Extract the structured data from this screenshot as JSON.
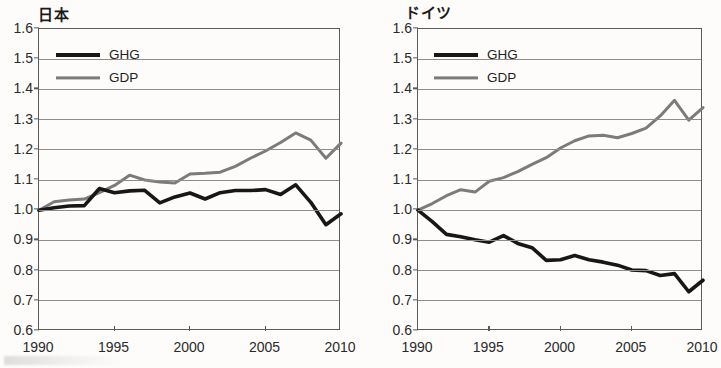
{
  "figure": {
    "background_color": "#fdfcfa",
    "axis_color": "#5a5a5a",
    "grid_color": "#8d8d8d",
    "ghg_color": "#171717",
    "gdp_color": "#7b7b7b"
  },
  "panels": [
    {
      "title": "日本",
      "legend": [
        {
          "label": "GHG",
          "series_key": "ghg"
        },
        {
          "label": "GDP",
          "series_key": "gdp"
        }
      ],
      "y_tick_labels": [
        "1.6",
        "1.5",
        "1.4",
        "1.3",
        "1.2",
        "1.1",
        "1.0",
        "0.9",
        "0.8",
        "0.7",
        "0.6"
      ],
      "x_tick_labels": [
        "1990",
        "1995",
        "2000",
        "2005",
        "2010"
      ]
    },
    {
      "title": "ドイツ",
      "legend": [
        {
          "label": "GHG",
          "series_key": "ghg"
        },
        {
          "label": "GDP",
          "series_key": "gdp"
        }
      ],
      "y_tick_labels": [
        "1.6",
        "1.5",
        "1.4",
        "1.3",
        "1.2",
        "1.1",
        "1.0",
        "0.9",
        "0.8",
        "0.7",
        "0.6"
      ],
      "x_tick_labels": [
        "1990",
        "1995",
        "2000",
        "2005",
        "2010"
      ]
    }
  ],
  "chart_data": [
    {
      "type": "line",
      "title": "日本",
      "xlabel": "",
      "ylabel": "",
      "xlim": [
        1990,
        2010
      ],
      "ylim": [
        0.6,
        1.6
      ],
      "ytick_step": 0.1,
      "xtick_step": 5,
      "grid": true,
      "legend_position": "inside top-left",
      "x": [
        1990,
        1991,
        1992,
        1993,
        1994,
        1995,
        1996,
        1997,
        1998,
        1999,
        2000,
        2001,
        2002,
        2003,
        2004,
        2005,
        2006,
        2007,
        2008,
        2009,
        2010
      ],
      "series": [
        {
          "name": "GHG",
          "color": "#171717",
          "values": [
            1.0,
            1.008,
            1.014,
            1.015,
            1.072,
            1.058,
            1.064,
            1.066,
            1.024,
            1.044,
            1.057,
            1.037,
            1.058,
            1.065,
            1.065,
            1.068,
            1.052,
            1.084,
            1.026,
            0.952,
            0.988
          ]
        },
        {
          "name": "GDP",
          "color": "#7b7b7b",
          "values": [
            1.0,
            1.028,
            1.034,
            1.037,
            1.058,
            1.082,
            1.116,
            1.1,
            1.093,
            1.09,
            1.12,
            1.122,
            1.126,
            1.145,
            1.172,
            1.196,
            1.224,
            1.256,
            1.232,
            1.172,
            1.222
          ]
        }
      ]
    },
    {
      "type": "line",
      "title": "ドイツ",
      "xlabel": "",
      "ylabel": "",
      "xlim": [
        1990,
        2010
      ],
      "ylim": [
        0.6,
        1.6
      ],
      "ytick_step": 0.1,
      "xtick_step": 5,
      "grid": true,
      "legend_position": "inside top-left",
      "x": [
        1990,
        1991,
        1992,
        1993,
        1994,
        1995,
        1996,
        1997,
        1998,
        1999,
        2000,
        2001,
        2002,
        2003,
        2004,
        2005,
        2006,
        2007,
        2008,
        2009,
        2010
      ],
      "series": [
        {
          "name": "GHG",
          "color": "#171717",
          "values": [
            1.0,
            0.962,
            0.92,
            0.912,
            0.902,
            0.894,
            0.916,
            0.89,
            0.876,
            0.834,
            0.836,
            0.85,
            0.836,
            0.828,
            0.818,
            0.802,
            0.8,
            0.784,
            0.79,
            0.73,
            0.768
          ]
        },
        {
          "name": "GDP",
          "color": "#7b7b7b",
          "values": [
            1.0,
            1.022,
            1.048,
            1.068,
            1.06,
            1.096,
            1.108,
            1.128,
            1.152,
            1.174,
            1.206,
            1.23,
            1.246,
            1.248,
            1.24,
            1.254,
            1.272,
            1.312,
            1.364,
            1.298,
            1.34
          ]
        }
      ]
    }
  ]
}
